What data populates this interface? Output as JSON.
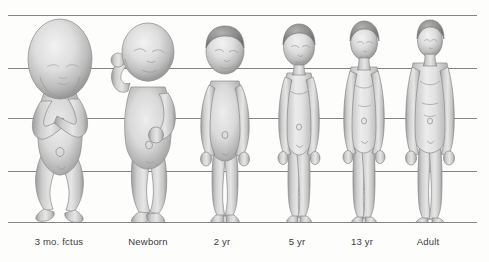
{
  "figure": {
    "background_color": "#fdfdfc",
    "gridline_color": "#6f6f6f",
    "label_color": "#3b3b3b",
    "body_tone": "#d8d8d8",
    "body_shadow": "#8f8f8f",
    "hair_tone": "#8c8c8c"
  },
  "gridlines": [
    {
      "name": "line-top",
      "y": 15
    },
    {
      "name": "line-2",
      "y": 68
    },
    {
      "name": "line-3",
      "y": 118
    },
    {
      "name": "line-4",
      "y": 171
    },
    {
      "name": "line-baseline",
      "y": 222
    }
  ],
  "stages": [
    {
      "label": "3 mo. fctus",
      "center_x": 59,
      "head_fraction": "1/4"
    },
    {
      "label": "Newborn",
      "center_x": 148,
      "head_fraction": "1/4"
    },
    {
      "label": "2 yr",
      "center_x": 222,
      "head_fraction": "1/5"
    },
    {
      "label": "5 yr",
      "center_x": 297,
      "head_fraction": "1/6"
    },
    {
      "label": "13 yr",
      "center_x": 362,
      "head_fraction": "1/7"
    },
    {
      "label": "Adult",
      "center_x": 428,
      "head_fraction": "1/8"
    }
  ]
}
